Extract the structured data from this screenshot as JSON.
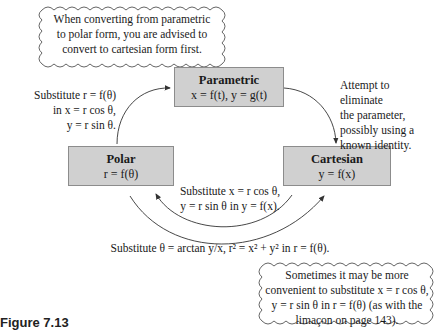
{
  "clouds": {
    "top": {
      "lines": [
        "When converting from parametric",
        "to polar form, you are advised to",
        "convert to cartesian form first."
      ]
    },
    "bottom": {
      "lines": [
        "Sometimes it may be more",
        "convenient to substitute x = r cos θ,",
        "y = r sin θ in r = f(θ) (as with the",
        "limaçon on page 143)."
      ]
    }
  },
  "boxes": {
    "parametric": {
      "title": "Parametric",
      "equation": "x = f(t), y = g(t)"
    },
    "polar": {
      "title": "Polar",
      "equation": "r = f(θ)"
    },
    "cartesian": {
      "title": "Cartesian",
      "equation": "y = f(x)"
    }
  },
  "notes": {
    "polar_to_parametric": [
      "Substitute r = f(θ)",
      "in x = r cos θ,",
      "y = r sin θ."
    ],
    "parametric_to_cartesian": [
      "Attempt to eliminate",
      "the parameter,",
      "possibly using a",
      "known identity."
    ],
    "cartesian_to_polar": [
      "Substitute x = r cos θ,",
      "y = r sin θ in y = f(x)."
    ],
    "polar_to_cartesian": "Substitute θ = arctan y/x, r² = x² + y² in r = f(θ)."
  },
  "colors": {
    "box_fill": "#d0d0d0",
    "box_border": "#8c8c8c",
    "line": "#333333"
  },
  "caption": "Figure 7.13"
}
